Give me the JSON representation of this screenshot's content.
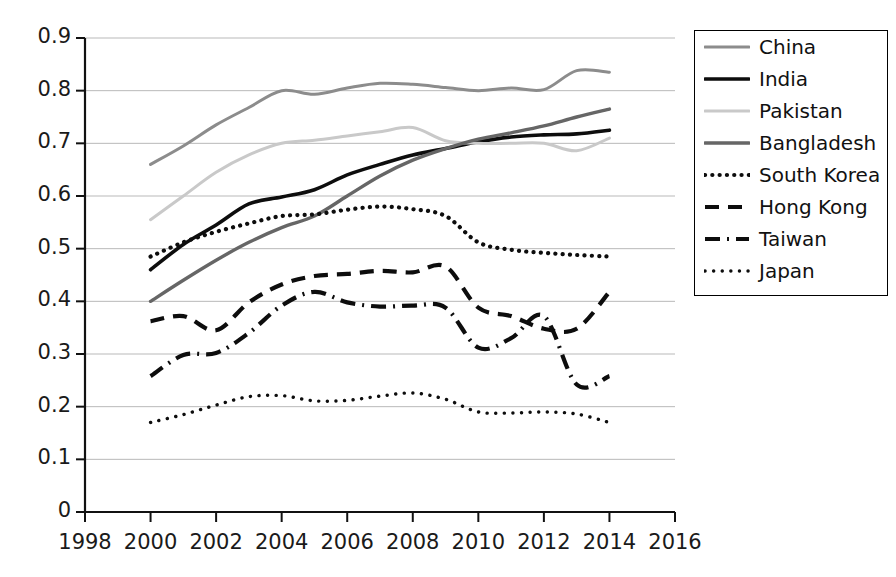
{
  "chart_data": {
    "type": "line",
    "title": "",
    "xlabel": "",
    "ylabel": "",
    "xlim": [
      1998,
      2016
    ],
    "ylim": [
      0,
      0.9
    ],
    "grid": true,
    "legend_position": "right-outside",
    "x_ticks": [
      "1998",
      "2000",
      "2002",
      "2004",
      "2006",
      "2008",
      "2010",
      "2012",
      "2014",
      "2016"
    ],
    "y_ticks": [
      "0",
      "0.1",
      "0.2",
      "0.3",
      "0.4",
      "0.5",
      "0.6",
      "0.7",
      "0.8",
      "0.9"
    ],
    "x": [
      2000,
      2001,
      2002,
      2003,
      2004,
      2005,
      2006,
      2007,
      2008,
      2009,
      2010,
      2011,
      2012,
      2013,
      2014
    ],
    "series": [
      {
        "name": "China",
        "style": "solid",
        "color": "#8c8c8c",
        "width": 3.0,
        "values": [
          0.66,
          0.695,
          0.735,
          0.768,
          0.8,
          0.793,
          0.805,
          0.814,
          0.812,
          0.806,
          0.8,
          0.805,
          0.802,
          0.838,
          0.835
        ]
      },
      {
        "name": "India",
        "style": "solid",
        "color": "#0d0d0d",
        "width": 3.6,
        "values": [
          0.46,
          0.508,
          0.545,
          0.585,
          0.598,
          0.612,
          0.64,
          0.66,
          0.678,
          0.69,
          0.703,
          0.712,
          0.716,
          0.718,
          0.725
        ]
      },
      {
        "name": "Pakistan",
        "style": "solid",
        "color": "#c9c9c9",
        "width": 3.0,
        "values": [
          0.555,
          0.6,
          0.645,
          0.678,
          0.7,
          0.706,
          0.714,
          0.722,
          0.73,
          0.705,
          0.7,
          0.7,
          0.7,
          0.686,
          0.71
        ]
      },
      {
        "name": "Bangladesh",
        "style": "solid",
        "color": "#666666",
        "width": 3.4,
        "values": [
          0.4,
          0.44,
          0.478,
          0.512,
          0.54,
          0.562,
          0.6,
          0.638,
          0.668,
          0.69,
          0.708,
          0.72,
          0.733,
          0.75,
          0.765
        ]
      },
      {
        "name": "South Korea",
        "style": "dotted",
        "color": "#0d0d0d",
        "width": 4.2,
        "values": [
          0.485,
          0.512,
          0.532,
          0.548,
          0.562,
          0.565,
          0.574,
          0.58,
          0.575,
          0.562,
          0.512,
          0.498,
          0.492,
          0.488,
          0.485
        ]
      },
      {
        "name": "Hong Kong",
        "style": "dashed",
        "color": "#0d0d0d",
        "width": 4.2,
        "values": [
          0.362,
          0.372,
          0.345,
          0.398,
          0.432,
          0.448,
          0.452,
          0.458,
          0.455,
          0.466,
          0.388,
          0.372,
          0.348,
          0.348,
          0.418
        ]
      },
      {
        "name": "Taiwan",
        "style": "dashdot",
        "color": "#0d0d0d",
        "width": 4.2,
        "values": [
          0.258,
          0.298,
          0.302,
          0.34,
          0.392,
          0.418,
          0.398,
          0.39,
          0.392,
          0.388,
          0.312,
          0.33,
          0.372,
          0.242,
          0.258
        ]
      },
      {
        "name": "Japan",
        "style": "dotted-fine",
        "color": "#0d0d0d",
        "width": 3.4,
        "values": [
          0.17,
          0.185,
          0.203,
          0.219,
          0.221,
          0.211,
          0.212,
          0.22,
          0.226,
          0.214,
          0.19,
          0.188,
          0.19,
          0.186,
          0.17
        ]
      }
    ]
  },
  "legend": {
    "items": [
      {
        "label": "China"
      },
      {
        "label": "India"
      },
      {
        "label": "Pakistan"
      },
      {
        "label": "Bangladesh"
      },
      {
        "label": "South Korea"
      },
      {
        "label": "Hong Kong"
      },
      {
        "label": "Taiwan"
      },
      {
        "label": "Japan"
      }
    ]
  }
}
